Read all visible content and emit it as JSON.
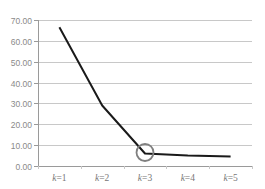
{
  "chart_data": {
    "type": "line",
    "title": "",
    "xlabel": "",
    "ylabel": "",
    "categories": [
      "k=1",
      "k=2",
      "k=3",
      "k=4",
      "k=5"
    ],
    "category_var": "k",
    "category_vals": [
      "1",
      "2",
      "3",
      "4",
      "5"
    ],
    "series": [
      {
        "name": "",
        "values": [
          66.5,
          29.0,
          6.0,
          5.0,
          4.5
        ]
      }
    ],
    "ylim": [
      0,
      70
    ],
    "yticks": [
      "0.00",
      "10.00",
      "20.00",
      "30.00",
      "40.00",
      "50.00",
      "60.00",
      "70.00"
    ],
    "grid": true,
    "legend": "none",
    "annotations": [
      {
        "type": "circle",
        "category": "k=3",
        "value": 6.0,
        "label": "elbow point"
      }
    ],
    "colors": {
      "line": "#1a1a1a",
      "grid": "#c8c8c8",
      "circle": "#808080",
      "axis": "#9a9a9a"
    }
  }
}
